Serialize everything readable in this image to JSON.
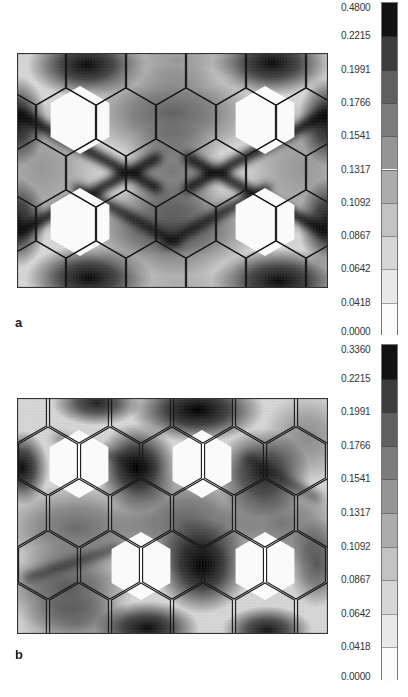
{
  "figure": {
    "panels": [
      {
        "id": "a",
        "label": "a",
        "frame": {
          "x": 17,
          "y": 53,
          "w": 311,
          "h": 235
        },
        "colorbar": {
          "x": 381,
          "top": 2,
          "height": 333,
          "max_label": "0.4800",
          "labels": [
            "0.4800",
            "0.2215",
            "0.1991",
            "0.1766",
            "0.1541",
            "0.1317",
            "0.1092",
            "0.0867",
            "0.0642",
            "0.0418",
            "0.0000"
          ]
        },
        "label_pos": {
          "x": 15,
          "y": 323
        },
        "hex_radius": 34,
        "hex_rows": [
          {
            "y": 18,
            "cx": [
              19,
              79,
              139,
              199,
              259,
              319
            ]
          },
          {
            "y": 69,
            "cx": [
              -11,
              49,
              109,
              169,
              229,
              289,
              349
            ]
          },
          {
            "y": 120,
            "cx": [
              19,
              79,
              139,
              199,
              259,
              319
            ]
          },
          {
            "y": 171,
            "cx": [
              -11,
              49,
              109,
              169,
              229,
              289,
              349
            ]
          },
          {
            "y": 222,
            "cx": [
              19,
              79,
              139,
              199,
              259,
              319
            ]
          }
        ],
        "white_hexes": [
          [
            63,
            67
          ],
          [
            248,
            67
          ],
          [
            63,
            169
          ],
          [
            248,
            169
          ]
        ],
        "blobs": [
          {
            "x": 70,
            "y": 12,
            "rx": 40,
            "ry": 22,
            "d": 0.95
          },
          {
            "x": 255,
            "y": 10,
            "rx": 40,
            "ry": 22,
            "d": 0.95
          },
          {
            "x": 72,
            "y": 225,
            "rx": 42,
            "ry": 22,
            "d": 0.95
          },
          {
            "x": 262,
            "y": 228,
            "rx": 45,
            "ry": 22,
            "d": 0.95
          },
          {
            "x": 155,
            "y": 60,
            "rx": 60,
            "ry": 32,
            "d": 0.55
          },
          {
            "x": 155,
            "y": 175,
            "rx": 60,
            "ry": 32,
            "d": 0.65
          },
          {
            "x": 155,
            "y": 118,
            "rx": 35,
            "ry": 33,
            "d": 0.45
          },
          {
            "x": 0,
            "y": 68,
            "rx": 20,
            "ry": 30,
            "d": 0.9
          },
          {
            "x": 311,
            "y": 68,
            "rx": 20,
            "ry": 30,
            "d": 0.9
          },
          {
            "x": 0,
            "y": 170,
            "rx": 20,
            "ry": 30,
            "d": 0.9
          },
          {
            "x": 311,
            "y": 170,
            "rx": 20,
            "ry": 30,
            "d": 0.9
          },
          {
            "x": 25,
            "y": 115,
            "rx": 40,
            "ry": 45,
            "d": 0.3
          },
          {
            "x": 285,
            "y": 115,
            "rx": 40,
            "ry": 45,
            "d": 0.3
          },
          {
            "x": 160,
            "y": 8,
            "rx": 40,
            "ry": 20,
            "d": 0.3
          },
          {
            "x": 160,
            "y": 230,
            "rx": 40,
            "ry": 20,
            "d": 0.2
          }
        ],
        "bands": [
          {
            "x1": 0,
            "y1": 60,
            "x2": 140,
            "y2": 135,
            "w": 10,
            "d": 0.95
          },
          {
            "x1": 311,
            "y1": 60,
            "x2": 171,
            "y2": 135,
            "w": 10,
            "d": 0.95
          },
          {
            "x1": 0,
            "y1": 180,
            "x2": 140,
            "y2": 105,
            "w": 10,
            "d": 0.95
          },
          {
            "x1": 311,
            "y1": 180,
            "x2": 171,
            "y2": 105,
            "w": 10,
            "d": 0.95
          },
          {
            "x1": 60,
            "y1": 135,
            "x2": 160,
            "y2": 190,
            "w": 9,
            "d": 0.85
          },
          {
            "x1": 250,
            "y1": 135,
            "x2": 150,
            "y2": 190,
            "w": 9,
            "d": 0.85
          }
        ]
      },
      {
        "id": "b",
        "label": "b",
        "frame": {
          "x": 17,
          "y": 398,
          "w": 311,
          "h": 236
        },
        "colorbar": {
          "x": 381,
          "top": 344,
          "height": 336,
          "max_label": "0.3360",
          "labels": [
            "0.3360",
            "0.2215",
            "0.1991",
            "0.1766",
            "0.1541",
            "0.1317",
            "0.1092",
            "0.0867",
            "0.0642",
            "0.0418",
            "0.0000"
          ]
        },
        "label_pos": {
          "x": 15,
          "y": 655
        },
        "hex_radius": 34,
        "hex_rows": [
          {
            "y": 11,
            "cx": [
              0,
              62,
              124,
              186,
              248,
              310
            ]
          },
          {
            "y": 63,
            "cx": [
              -31,
              31,
              93,
              155,
              217,
              279,
              341
            ]
          },
          {
            "y": 115,
            "cx": [
              0,
              62,
              124,
              186,
              248,
              310
            ]
          },
          {
            "y": 167,
            "cx": [
              -31,
              31,
              93,
              155,
              217,
              279,
              341
            ]
          },
          {
            "y": 219,
            "cx": [
              0,
              62,
              124,
              186,
              248,
              310
            ]
          }
        ],
        "white_hexes": [
          [
            62,
            66
          ],
          [
            185,
            66
          ],
          [
            124,
            168
          ],
          [
            248,
            168
          ]
        ],
        "blobs": [
          {
            "x": 80,
            "y": 5,
            "rx": 30,
            "ry": 15,
            "d": 0.85
          },
          {
            "x": 180,
            "y": 12,
            "rx": 45,
            "ry": 22,
            "d": 1.0
          },
          {
            "x": 120,
            "y": 70,
            "rx": 28,
            "ry": 30,
            "d": 1.0
          },
          {
            "x": 245,
            "y": 75,
            "rx": 32,
            "ry": 30,
            "d": 0.85
          },
          {
            "x": 5,
            "y": 70,
            "rx": 18,
            "ry": 25,
            "d": 0.95
          },
          {
            "x": 185,
            "y": 168,
            "rx": 32,
            "ry": 32,
            "d": 1.0
          },
          {
            "x": 130,
            "y": 230,
            "rx": 35,
            "ry": 18,
            "d": 0.95
          },
          {
            "x": 250,
            "y": 232,
            "rx": 30,
            "ry": 16,
            "d": 0.9
          },
          {
            "x": 60,
            "y": 130,
            "rx": 55,
            "ry": 30,
            "d": 0.5
          },
          {
            "x": 170,
            "y": 125,
            "rx": 50,
            "ry": 35,
            "d": 0.55
          },
          {
            "x": 265,
            "y": 125,
            "rx": 45,
            "ry": 30,
            "d": 0.45
          },
          {
            "x": 50,
            "y": 190,
            "rx": 45,
            "ry": 30,
            "d": 0.6
          },
          {
            "x": 300,
            "y": 165,
            "rx": 20,
            "ry": 30,
            "d": 0.6
          },
          {
            "x": 60,
            "y": 225,
            "rx": 40,
            "ry": 20,
            "d": 0.4
          },
          {
            "x": 290,
            "y": 40,
            "rx": 30,
            "ry": 30,
            "d": 0.35
          }
        ],
        "bands": [
          {
            "x1": 40,
            "y1": 40,
            "x2": 130,
            "y2": 70,
            "w": 8,
            "d": 0.45
          },
          {
            "x1": 10,
            "y1": 180,
            "x2": 100,
            "y2": 150,
            "w": 8,
            "d": 0.6
          },
          {
            "x1": 230,
            "y1": 60,
            "x2": 300,
            "y2": 100,
            "w": 8,
            "d": 0.5
          }
        ]
      }
    ]
  },
  "chart_data": [
    {
      "type": "heatmap",
      "title": "a",
      "colorbar_levels": [
        0.0,
        0.0418,
        0.0642,
        0.0867,
        0.1092,
        0.1317,
        0.1541,
        0.1766,
        0.1991,
        0.2215,
        0.48
      ],
      "colorbar_min": 0.0,
      "colorbar_max": 0.48,
      "colormap": "grayscale (white=low, black=high)",
      "xlabel": "",
      "ylabel": "",
      "description": "Field map over a hexagonal cell lattice; 4 white (zero) hexagonal inclusions; dark diagonal bands connecting inclusions."
    },
    {
      "type": "heatmap",
      "title": "b",
      "colorbar_levels": [
        0.0,
        0.0418,
        0.0642,
        0.0867,
        0.1092,
        0.1317,
        0.1541,
        0.1766,
        0.1991,
        0.2215,
        0.336
      ],
      "colorbar_min": 0.0,
      "colorbar_max": 0.336,
      "colormap": "grayscale (white=low, black=high)",
      "xlabel": "",
      "ylabel": "",
      "description": "Field map over a hexagonal cell lattice; 4 white (zero) hexagonal inclusions in staggered arrangement; dark patches between inclusions."
    }
  ]
}
